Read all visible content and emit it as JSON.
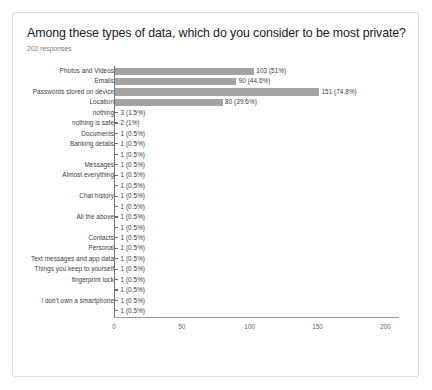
{
  "card": {
    "title": "Among these types of data, which do you consider to be most private?",
    "responses": "202 responses"
  },
  "chart_data": {
    "type": "bar",
    "orientation": "horizontal",
    "title": "Among these types of data, which do you consider to be most private?",
    "subtitle": "202 responses",
    "xlabel": "",
    "ylabel": "",
    "xlim": [
      0,
      210
    ],
    "grid": false,
    "legend": null,
    "total_responses": 202,
    "bar_color": "#a3a3a3",
    "xticks": [
      0,
      50,
      100,
      150,
      200
    ],
    "xtick_labels": [
      "0",
      "50",
      "100",
      "150",
      "200"
    ],
    "categories": [
      "Photos and Videos",
      "Emails",
      "Passwords stored on device",
      "Location",
      "nothing",
      "nothing is safe",
      "Documents",
      "Banking details",
      "",
      "Messages",
      "Almost everything",
      "",
      "Chat history",
      "",
      "All the above",
      "",
      "Contacts",
      "Personal",
      "Text messages and app data",
      "Things you keep to yourself",
      "fingerprint lock",
      "",
      "I don't own a smartphone",
      ""
    ],
    "values": [
      103,
      90,
      151,
      80,
      3,
      2,
      1,
      1,
      1,
      1,
      1,
      1,
      1,
      1,
      1,
      1,
      1,
      1,
      1,
      1,
      1,
      1,
      1,
      1
    ],
    "percent_labels": [
      "51%",
      "44.6%",
      "74.8%",
      "39.6%",
      "1.5%",
      "1%",
      "0.5%",
      "0.5%",
      "0.5%",
      "0.5%",
      "0.5%",
      "0.5%",
      "0.5%",
      "0.5%",
      "0.5%",
      "0.5%",
      "0.5%",
      "0.5%",
      "0.5%",
      "0.5%",
      "0.5%",
      "0.5%",
      "0.5%",
      "0.5%"
    ],
    "data_labels": [
      "103 (51%)",
      "90 (44.6%)",
      "151 (74.8%)",
      "80 (39.6%)",
      "3 (1.5%)",
      "2 (1%)",
      "1 (0.5%)",
      "1 (0.5%)",
      "1 (0.5%)",
      "1 (0.5%)",
      "1 (0.5%)",
      "1 (0.5%)",
      "1 (0.5%)",
      "1 (0.5%)",
      "1 (0.5%)",
      "1 (0.5%)",
      "1 (0.5%)",
      "1 (0.5%)",
      "1 (0.5%)",
      "1 (0.5%)",
      "1 (0.5%)",
      "1 (0.5%)",
      "1 (0.5%)",
      "1 (0.5%)"
    ]
  }
}
